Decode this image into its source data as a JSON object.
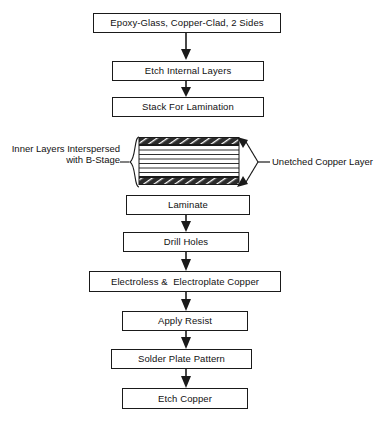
{
  "diagram": {
    "type": "process-flowchart",
    "orientation": "top-to-bottom",
    "colors": {
      "background": "#ffffff",
      "stroke": "#1a1a1a",
      "text": "#111111",
      "copper_hatch_fill": "#2b2b2b",
      "box_fill": "#ffffff"
    }
  },
  "flow": {
    "upper_steps": [
      {
        "id": "step-epoxy-glass",
        "label": "Epoxy-Glass, Copper-Clad, 2 Sides"
      },
      {
        "id": "step-etch-internal-layers",
        "label": "Etch Internal Layers"
      },
      {
        "id": "step-stack-for-lamination",
        "label": "Stack For Lamination"
      }
    ],
    "lower_steps": [
      {
        "id": "step-laminate",
        "label": "Laminate"
      },
      {
        "id": "step-drill-holes",
        "label": "Drill Holes"
      },
      {
        "id": "step-electroless-electroplate-copper",
        "label": "Electroless &  Electroplate Copper"
      },
      {
        "id": "step-apply-resist",
        "label": "Apply Resist"
      },
      {
        "id": "step-solder-plate-pattern",
        "label": "Solder Plate Pattern"
      },
      {
        "id": "step-etch-copper",
        "label": "Etch Copper"
      }
    ],
    "connector_count": 7,
    "connector_style": "solid-line-with-filled-triangle-arrowhead"
  },
  "stack_illustration": {
    "id": "lamination-stack",
    "description": "Cross-section of stacked inner layers with hatched copper layers top and bottom",
    "inner_line_count": 6,
    "copper_band_pattern": "diagonal-hatch",
    "left_annotation": {
      "id": "annotation-inner-layers",
      "label": "Inner Layers Interspersed\nwith B-Stage",
      "brace": "left-curly-brace"
    },
    "right_annotation": {
      "id": "annotation-unetched-copper",
      "label": "Unetched Copper Layer",
      "arrow_targets": 2,
      "arrow_target_names": [
        "top-copper-band",
        "bottom-copper-band"
      ]
    }
  }
}
